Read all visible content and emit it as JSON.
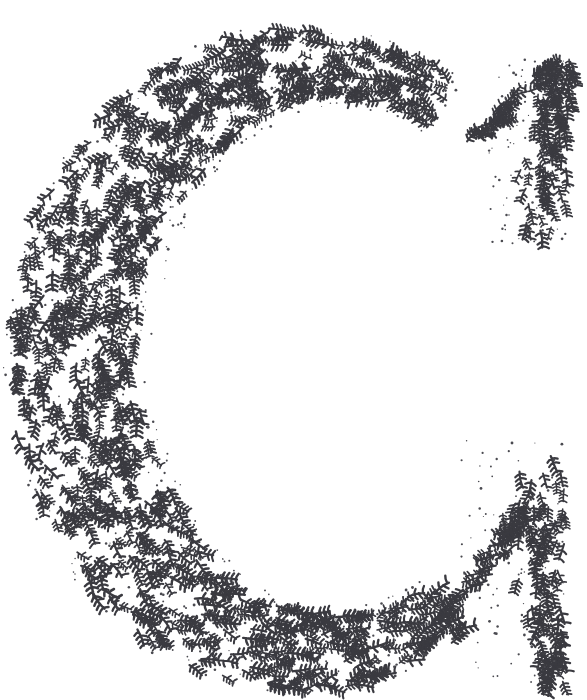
{
  "artwork": {
    "title": "Decorative Foliate Initial C",
    "glyph": "C",
    "style": "vine-and-leaf stippled initial",
    "background_color": "#ffffff",
    "ink_color": "#3a3a40",
    "speck_color": "#4a4a50",
    "canvas": {
      "width": 587,
      "height": 700
    },
    "motif": {
      "name": "leaf-sprig",
      "description": "short curved stem with alternating paired leaflets, fern-like",
      "stem_length_px": 16,
      "leaflet_length_px": 5,
      "leaflet_pairs": 4,
      "stroke_width_px": 2.1
    },
    "speckle": {
      "name": "ink-speck",
      "description": "scattered round dots between sprigs",
      "radius_px": 1.0,
      "count": 900
    },
    "sprig_count": 1150,
    "letter_geometry": {
      "description": "Open C: broad left bowl, thin top and bottom arcs, barbed wedge serifs at both right terminals",
      "bowl_center": {
        "x": 300,
        "y": 360
      },
      "outer_radius_x": 292,
      "outer_radius_y": 332,
      "left_stroke_thickness": 128,
      "top_arc_thickness": 56,
      "bottom_arc_thickness": 62,
      "aperture_start_deg": -56,
      "aperture_end_deg": 56,
      "top_terminal": {
        "tip_x": 563,
        "tip_y": 58,
        "foot_x": 536,
        "foot_y": 246
      },
      "bottom_terminal": {
        "tip_x": 560,
        "tip_y": 682,
        "crest_x": 545,
        "crest_y": 444
      }
    }
  }
}
